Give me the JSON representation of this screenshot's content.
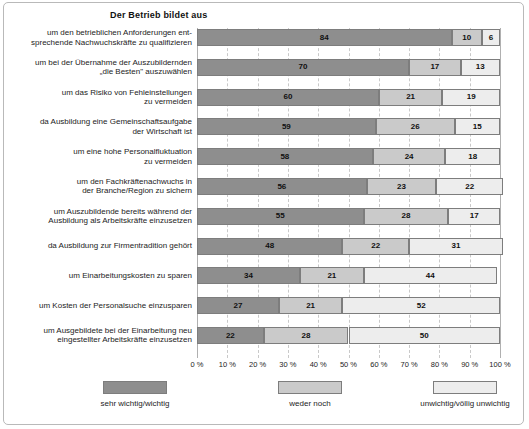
{
  "chart_data": {
    "type": "bar",
    "subtype": "stacked-horizontal-100",
    "title": "Der Betrieb bildet aus",
    "xlabel": "",
    "ylabel": "",
    "xlim": [
      0,
      100
    ],
    "grid": true,
    "legend_position": "bottom",
    "xticks": [
      "0 %",
      "10 %",
      "20 %",
      "30 %",
      "40 %",
      "50 %",
      "60 %",
      "70 %",
      "80 %",
      "90 %",
      "100 %"
    ],
    "xtick_values": [
      0,
      10,
      20,
      30,
      40,
      50,
      60,
      70,
      80,
      90,
      100
    ],
    "categories": [
      "um den betrieblichen Anforderungen ent-\nsprechende Nachwuchskräfte zu qualifizieren",
      "um bei der Übernahme der Auszubildernden\n„die Besten\" auszuwählen",
      "um das Risiko von Fehleinstellungen\nzu vermeiden",
      "da Ausbildung eine Gemeinschaftsaufgabe\nder Wirtschaft ist",
      "um eine hohe Personalfluktuation\nzu vermeiden",
      "um den Fachkräftenachwuchs in\nder Branche/Region zu sichern",
      "um Auszubildende bereits während der\nAusbildung als Arbeitskräfte einzusetzen",
      "da Ausbildung zur Firmentradition gehört",
      "um Einarbeitungskosten zu sparen",
      "um Kosten der Personalsuche einzusparen",
      "um Ausgebildete bei der Einarbeitung neu\neingestellter Arbeitskräfte einzusetzen"
    ],
    "series": [
      {
        "name": "sehr wichtig/wichtig",
        "color": "#8e8e8e",
        "values": [
          84,
          70,
          60,
          59,
          58,
          56,
          55,
          48,
          34,
          27,
          22
        ]
      },
      {
        "name": "weder noch",
        "color": "#cacaca",
        "values": [
          10,
          17,
          21,
          26,
          24,
          23,
          28,
          22,
          21,
          21,
          28
        ]
      },
      {
        "name": "unwichtig/völlig unwichtig",
        "color": "#ededed",
        "values": [
          6,
          13,
          19,
          15,
          18,
          22,
          17,
          31,
          44,
          52,
          50
        ]
      }
    ]
  },
  "legend": {
    "items": [
      {
        "label": "sehr wichtig/wichtig",
        "color": "#8e8e8e"
      },
      {
        "label": "weder noch",
        "color": "#cacaca"
      },
      {
        "label": "unwichtig/völlig unwichtig",
        "color": "#ededed"
      }
    ]
  }
}
